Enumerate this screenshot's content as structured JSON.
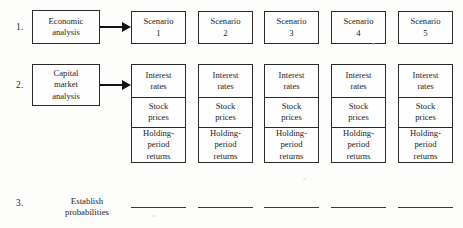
{
  "figure": {
    "type": "flowchart"
  },
  "steps": [
    {
      "number": "1.",
      "driver_lines": [
        "Economic",
        "analysis"
      ]
    },
    {
      "number": "2.",
      "driver_lines": [
        "Capital",
        "market",
        "analysis"
      ]
    },
    {
      "number": "3.",
      "label_lines": [
        "Establish",
        "probabilities"
      ]
    }
  ],
  "scenarios": [
    {
      "title": "Scenario",
      "index": "1"
    },
    {
      "title": "Scenario",
      "index": "2"
    },
    {
      "title": "Scenario",
      "index": "3"
    },
    {
      "title": "Scenario",
      "index": "4"
    },
    {
      "title": "Scenario",
      "index": "5"
    }
  ],
  "detail_cells": [
    {
      "lines": [
        "Interest",
        "rates"
      ]
    },
    {
      "lines": [
        "Stock",
        "prices"
      ]
    },
    {
      "lines": [
        "Holding-",
        "period",
        "returns"
      ]
    }
  ],
  "probability_rules": [
    {
      "value": ""
    },
    {
      "value": ""
    },
    {
      "value": ""
    },
    {
      "value": ""
    },
    {
      "value": ""
    }
  ],
  "colors": {
    "ink": "#1d1d1d",
    "border": "#2b2b2b",
    "arrow": "#141414",
    "rule": "#3a3a3a",
    "paper": "#fdfdfc"
  }
}
